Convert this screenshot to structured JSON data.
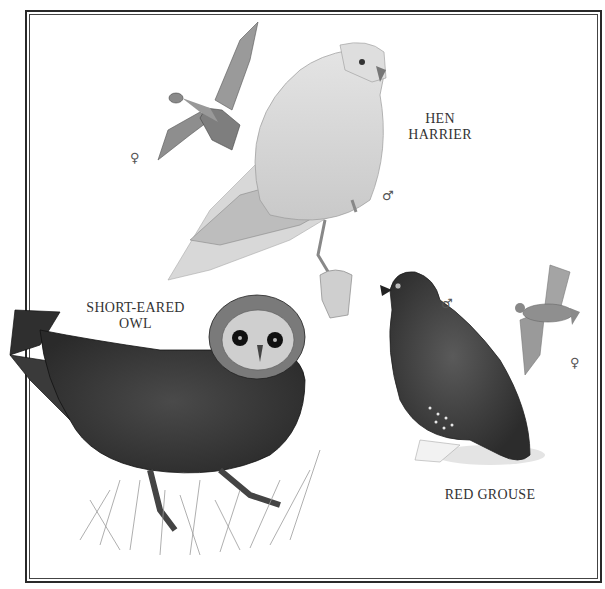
{
  "plate": {
    "border_color": "#2a2a2a",
    "background": "#ffffff"
  },
  "species": [
    {
      "id": "hen-harrier",
      "label_line1": "HEN",
      "label_line2": "HARRIER",
      "female_symbol": "♀",
      "male_symbol": "♂"
    },
    {
      "id": "short-eared-owl",
      "label_line1": "SHORT-EARED",
      "label_line2": "OWL"
    },
    {
      "id": "red-grouse",
      "label_line1": "RED GROUSE",
      "male_symbol": "♂",
      "female_symbol": "♀"
    }
  ]
}
